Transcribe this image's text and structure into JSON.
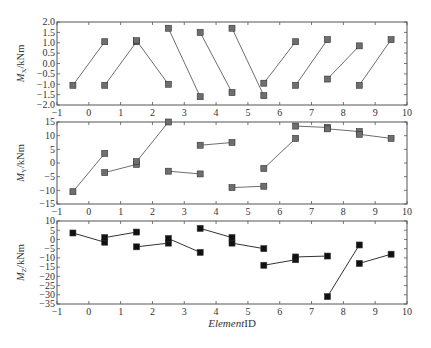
{
  "chart_data": [
    {
      "type": "line",
      "title": "",
      "ylabel": "Mx/kNm",
      "ylabel_parts": {
        "symbol": "M",
        "subscript": "X",
        "unit": "/kNm"
      },
      "xlabel": "",
      "xlim": [
        -1,
        10
      ],
      "ylim": [
        -2.0,
        2.0
      ],
      "yticks": [
        -2.0,
        -1.5,
        -1.0,
        -0.5,
        0.0,
        0.5,
        1.0,
        1.5,
        2.0
      ],
      "ytick_labels": [
        "−2.0",
        "−1.5",
        "−1.0",
        "−0.5",
        "0.0",
        "0.5",
        "1.0",
        "1.5",
        "2.0"
      ],
      "xticks": [
        -1,
        0,
        1,
        2,
        3,
        4,
        5,
        6,
        7,
        8,
        9,
        10
      ],
      "xtick_labels": [
        "−1",
        "0",
        "1",
        "2",
        "3",
        "4",
        "5",
        "6",
        "7",
        "8",
        "9",
        "10"
      ],
      "marker": "square",
      "marker_color": "#6e6e6e",
      "line_color": "#6e6e6e",
      "grid": false,
      "segments": [
        {
          "element": 0,
          "x": [
            -0.5,
            0.5
          ],
          "y": [
            -1.05,
            1.05
          ]
        },
        {
          "element": 1,
          "x": [
            0.5,
            1.5
          ],
          "y": [
            -1.05,
            1.05
          ]
        },
        {
          "element": 2,
          "x": [
            1.5,
            2.5
          ],
          "y": [
            1.1,
            -1.0
          ]
        },
        {
          "element": 3,
          "x": [
            2.5,
            3.5
          ],
          "y": [
            1.7,
            -1.6
          ]
        },
        {
          "element": 4,
          "x": [
            3.5,
            4.5
          ],
          "y": [
            1.5,
            -1.4
          ]
        },
        {
          "element": 5,
          "x": [
            4.5,
            5.5
          ],
          "y": [
            1.7,
            -1.55
          ]
        },
        {
          "element": 6,
          "x": [
            5.5,
            6.5
          ],
          "y": [
            -0.95,
            1.05
          ]
        },
        {
          "element": 7,
          "x": [
            6.5,
            7.5
          ],
          "y": [
            -1.05,
            1.15
          ]
        },
        {
          "element": 8,
          "x": [
            7.5,
            8.5
          ],
          "y": [
            -0.75,
            0.85
          ]
        },
        {
          "element": 9,
          "x": [
            8.5,
            9.5
          ],
          "y": [
            -1.05,
            1.15
          ]
        }
      ]
    },
    {
      "type": "line",
      "title": "",
      "ylabel": "My/kNm",
      "ylabel_parts": {
        "symbol": "M",
        "subscript": "Y",
        "unit": "/kNm"
      },
      "xlabel": "",
      "xlim": [
        -1,
        10
      ],
      "ylim": [
        -15,
        15
      ],
      "yticks": [
        -15,
        -10,
        -5,
        0,
        5,
        10,
        15
      ],
      "ytick_labels": [
        "−15",
        "−10",
        "−5",
        "0",
        "5",
        "10",
        "15"
      ],
      "xticks": [
        -1,
        0,
        1,
        2,
        3,
        4,
        5,
        6,
        7,
        8,
        9,
        10
      ],
      "xtick_labels": [
        "−1",
        "0",
        "1",
        "2",
        "3",
        "4",
        "5",
        "6",
        "7",
        "8",
        "9",
        "10"
      ],
      "marker": "square",
      "marker_color": "#6e6e6e",
      "line_color": "#6e6e6e",
      "grid": false,
      "segments": [
        {
          "element": 0,
          "x": [
            -0.5,
            0.5
          ],
          "y": [
            -10.5,
            3.5
          ]
        },
        {
          "element": 1,
          "x": [
            0.5,
            1.5
          ],
          "y": [
            -3.5,
            -0.5
          ]
        },
        {
          "element": 2,
          "x": [
            1.5,
            2.5
          ],
          "y": [
            0.5,
            15.0
          ]
        },
        {
          "element": 3,
          "x": [
            2.5,
            3.5
          ],
          "y": [
            -3.0,
            -4.0
          ]
        },
        {
          "element": 4,
          "x": [
            3.5,
            4.5
          ],
          "y": [
            6.5,
            7.5
          ]
        },
        {
          "element": 5,
          "x": [
            4.5,
            5.5
          ],
          "y": [
            -9.0,
            -8.5
          ]
        },
        {
          "element": 6,
          "x": [
            5.5,
            6.5
          ],
          "y": [
            -2.0,
            9.0
          ]
        },
        {
          "element": 7,
          "x": [
            6.5,
            7.5
          ],
          "y": [
            13.5,
            13.0
          ]
        },
        {
          "element": 8,
          "x": [
            7.5,
            8.5
          ],
          "y": [
            12.5,
            11.5
          ]
        },
        {
          "element": 9,
          "x": [
            8.5,
            9.5
          ],
          "y": [
            10.5,
            9.0
          ]
        }
      ]
    },
    {
      "type": "line",
      "title": "",
      "ylabel": "Mz/kNm",
      "ylabel_parts": {
        "symbol": "M",
        "subscript": "Z",
        "unit": "/kNm"
      },
      "xlabel": "ElementID",
      "xlabel_parts": {
        "italic": "Element",
        "normal": "ID"
      },
      "xlim": [
        -1,
        10
      ],
      "ylim": [
        -35,
        10
      ],
      "yticks": [
        -35,
        -30,
        -25,
        -20,
        -15,
        -10,
        -5,
        0,
        5,
        10
      ],
      "ytick_labels": [
        "−35",
        "−30",
        "−25",
        "−20",
        "−15",
        "−10",
        "−5",
        "0",
        "5",
        "10"
      ],
      "xticks": [
        -1,
        0,
        1,
        2,
        3,
        4,
        5,
        6,
        7,
        8,
        9,
        10
      ],
      "xtick_labels": [
        "−1",
        "0",
        "1",
        "2",
        "3",
        "4",
        "5",
        "6",
        "7",
        "8",
        "9",
        "10"
      ],
      "marker": "square",
      "marker_color": "#111111",
      "line_color": "#333333",
      "grid": false,
      "segments": [
        {
          "element": 0,
          "x": [
            -0.5,
            0.5
          ],
          "y": [
            3.5,
            -1.5
          ]
        },
        {
          "element": 1,
          "x": [
            0.5,
            1.5
          ],
          "y": [
            1.0,
            4.0
          ]
        },
        {
          "element": 2,
          "x": [
            1.5,
            2.5
          ],
          "y": [
            -4.0,
            -2.0
          ]
        },
        {
          "element": 3,
          "x": [
            2.5,
            3.5
          ],
          "y": [
            0.5,
            -7.0
          ]
        },
        {
          "element": 4,
          "x": [
            3.5,
            4.5
          ],
          "y": [
            6.0,
            1.0
          ]
        },
        {
          "element": 5,
          "x": [
            4.5,
            5.5
          ],
          "y": [
            -2.0,
            -5.0
          ]
        },
        {
          "element": 6,
          "x": [
            5.5,
            6.5
          ],
          "y": [
            -14.0,
            -11.0
          ]
        },
        {
          "element": 7,
          "x": [
            6.5,
            7.5
          ],
          "y": [
            -9.5,
            -9.0
          ]
        },
        {
          "element": 8,
          "x": [
            7.5,
            8.5
          ],
          "y": [
            -31.0,
            -3.0
          ]
        },
        {
          "element": 9,
          "x": [
            8.5,
            9.5
          ],
          "y": [
            -13.0,
            -8.0
          ]
        }
      ]
    }
  ],
  "layout": {
    "panels": [
      {
        "left": 57,
        "right": 407,
        "top": 22,
        "bottom": 105
      },
      {
        "left": 57,
        "right": 407,
        "top": 122,
        "bottom": 204
      },
      {
        "left": 57,
        "right": 407,
        "top": 221,
        "bottom": 304
      }
    ],
    "xlabel_y": 327
  }
}
